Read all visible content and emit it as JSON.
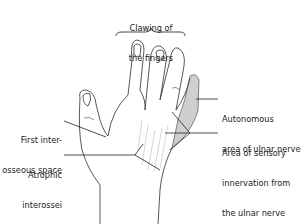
{
  "figure": {
    "shade_color": "#cfcfcf",
    "line_color": "#333333"
  },
  "labels": {
    "clawing": [
      "Clawing of",
      "the fingers"
    ],
    "first_interosseous": [
      "First inter-",
      "osseous space"
    ],
    "atrophic": [
      "Atrophic",
      "interossei"
    ],
    "autonomous": [
      "Autonomous",
      "area of ulnar nerve"
    ],
    "sensory": [
      "Area of sensory",
      "innervation from",
      "the ulnar nerve"
    ]
  }
}
